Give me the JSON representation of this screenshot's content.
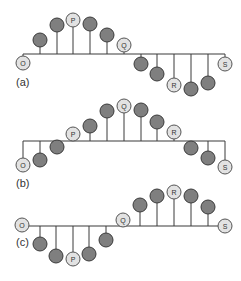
{
  "figure": {
    "ball_radius": 7,
    "colors": {
      "ball": "#7f7f7f",
      "labeled_ball": "#e2e2e2",
      "line": "#3a3a3a"
    },
    "panels": [
      {
        "label": "(a)",
        "label_pos": [
          16,
          76
        ],
        "baseline_y": 54,
        "baseline_x": [
          23,
          225
        ],
        "balls": [
          {
            "x": 23,
            "y": 63,
            "text": "O"
          },
          {
            "x": 40,
            "y": 40,
            "text": ""
          },
          {
            "x": 57,
            "y": 25,
            "text": ""
          },
          {
            "x": 73,
            "y": 20,
            "text": "P"
          },
          {
            "x": 90,
            "y": 24,
            "text": ""
          },
          {
            "x": 107,
            "y": 35,
            "text": ""
          },
          {
            "x": 124,
            "y": 45,
            "text": "Q"
          },
          {
            "x": 141,
            "y": 64,
            "text": ""
          },
          {
            "x": 157,
            "y": 74,
            "text": ""
          },
          {
            "x": 174,
            "y": 85,
            "text": "R"
          },
          {
            "x": 191,
            "y": 89,
            "text": ""
          },
          {
            "x": 208,
            "y": 83,
            "text": ""
          },
          {
            "x": 225,
            "y": 64,
            "text": "S"
          }
        ]
      },
      {
        "label": "(b)",
        "label_pos": [
          16,
          177
        ],
        "baseline_y": 141,
        "baseline_x": [
          23,
          225
        ],
        "balls": [
          {
            "x": 23,
            "y": 165,
            "text": "O"
          },
          {
            "x": 40,
            "y": 160,
            "text": ""
          },
          {
            "x": 57,
            "y": 147,
            "text": ""
          },
          {
            "x": 73,
            "y": 134,
            "text": "P"
          },
          {
            "x": 90,
            "y": 126,
            "text": ""
          },
          {
            "x": 107,
            "y": 111,
            "text": ""
          },
          {
            "x": 124,
            "y": 106,
            "text": "Q"
          },
          {
            "x": 141,
            "y": 110,
            "text": ""
          },
          {
            "x": 157,
            "y": 122,
            "text": ""
          },
          {
            "x": 174,
            "y": 132,
            "text": "R"
          },
          {
            "x": 191,
            "y": 148,
            "text": ""
          },
          {
            "x": 208,
            "y": 158,
            "text": ""
          },
          {
            "x": 225,
            "y": 167,
            "text": "S"
          }
        ]
      },
      {
        "label": "(c)",
        "label_pos": [
          16,
          236
        ],
        "baseline_y": 226,
        "baseline_x": [
          22,
          225
        ],
        "balls": [
          {
            "x": 22,
            "y": 225,
            "text": "O"
          },
          {
            "x": 40,
            "y": 244,
            "text": ""
          },
          {
            "x": 56,
            "y": 256,
            "text": ""
          },
          {
            "x": 73,
            "y": 259,
            "text": "P"
          },
          {
            "x": 89,
            "y": 254,
            "text": ""
          },
          {
            "x": 106,
            "y": 240,
            "text": ""
          },
          {
            "x": 123,
            "y": 220,
            "text": "Q"
          },
          {
            "x": 140,
            "y": 205,
            "text": ""
          },
          {
            "x": 157,
            "y": 196,
            "text": ""
          },
          {
            "x": 174,
            "y": 192,
            "text": "R"
          },
          {
            "x": 191,
            "y": 196,
            "text": ""
          },
          {
            "x": 208,
            "y": 207,
            "text": ""
          },
          {
            "x": 225,
            "y": 226,
            "text": "S"
          }
        ]
      }
    ]
  }
}
